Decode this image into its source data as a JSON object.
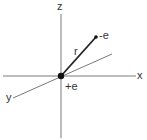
{
  "diagram": {
    "type": "coordinate-system",
    "colors": {
      "axis": "#7a7a7a",
      "vector": "#222222",
      "charge": "#111111",
      "text": "#333333"
    },
    "axes": {
      "x": {
        "label": "x"
      },
      "y": {
        "label": "y"
      },
      "z": {
        "label": "z"
      }
    },
    "origin_charge": {
      "label": "+e"
    },
    "particle_charge": {
      "label": "-e"
    },
    "vector": {
      "label": "r"
    }
  }
}
